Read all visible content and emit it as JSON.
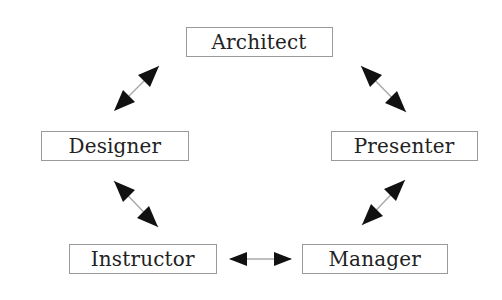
{
  "diagram": {
    "nodes": [
      {
        "id": "architect",
        "label": "Architect",
        "x": 186,
        "y": 27,
        "w": 147,
        "h": 30
      },
      {
        "id": "designer",
        "label": "Designer",
        "x": 41,
        "y": 131,
        "w": 148,
        "h": 30
      },
      {
        "id": "presenter",
        "label": "Presenter",
        "x": 331,
        "y": 131,
        "w": 147,
        "h": 30
      },
      {
        "id": "instructor",
        "label": "Instructor",
        "x": 69,
        "y": 244,
        "w": 148,
        "h": 30
      },
      {
        "id": "manager",
        "label": "Manager",
        "x": 302,
        "y": 244,
        "w": 146,
        "h": 30
      }
    ],
    "edges": [
      {
        "from": "designer",
        "to": "architect",
        "type": "bidirectional"
      },
      {
        "from": "architect",
        "to": "presenter",
        "type": "bidirectional"
      },
      {
        "from": "designer",
        "to": "instructor",
        "type": "bidirectional"
      },
      {
        "from": "presenter",
        "to": "manager",
        "type": "bidirectional"
      },
      {
        "from": "instructor",
        "to": "manager",
        "type": "bidirectional"
      }
    ],
    "colors": {
      "border": "#9a9a9a",
      "text": "#222222",
      "arrow": "#111111",
      "shaft": "#aaaaaa"
    }
  }
}
